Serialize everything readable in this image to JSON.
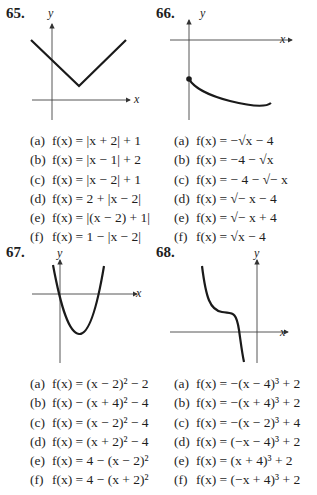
{
  "problems": [
    {
      "number": "65.",
      "graph": {
        "description": "V-shaped absolute value graph with vertex at (2, 1)",
        "x_axis_label": "x",
        "y_axis_label": "y"
      },
      "choices": [
        {
          "label": "(a)",
          "expr": "f(x) = |x + 2| + 1"
        },
        {
          "label": "(b)",
          "expr": "f(x) = |x − 1| + 2"
        },
        {
          "label": "(c)",
          "expr": "f(x) = |x − 2| + 1"
        },
        {
          "label": "(d)",
          "expr": "f(x) = 2 + |x − 2|"
        },
        {
          "label": "(e)",
          "expr": "f(x) = |(x − 2) + 1|"
        },
        {
          "label": "(f)",
          "expr": "f(x) = 1 − |x − 2|"
        }
      ]
    },
    {
      "number": "66.",
      "graph": {
        "description": "Decreasing square-root curve starting at closed point on y-axis below origin",
        "x_axis_label": "x",
        "y_axis_label": "y"
      },
      "choices": [
        {
          "label": "(a)",
          "expr": "f(x) = −√x − 4"
        },
        {
          "label": "(b)",
          "expr": "f(x) = −4 − √x"
        },
        {
          "label": "(c)",
          "expr": "f(x) =  − 4 − √− x"
        },
        {
          "label": "(d)",
          "expr": "f(x) = √− x − 4"
        },
        {
          "label": "(e)",
          "expr": "f(x) = √− x + 4"
        },
        {
          "label": "(f)",
          "expr": "f(x) = √x − 4"
        }
      ]
    },
    {
      "number": "67.",
      "graph": {
        "description": "Upward parabola crossing x-axis at origin with vertex below x-axis",
        "x_axis_label": "x",
        "y_axis_label": "y"
      },
      "choices": [
        {
          "label": "(a)",
          "expr": "f(x) = (x − 2)² − 2"
        },
        {
          "label": "(b)",
          "expr": "f(x) − (x + 4)² − 4"
        },
        {
          "label": "(c)",
          "expr": "f(x) = (x − 2)² − 4"
        },
        {
          "label": "(d)",
          "expr": "f(x) = (x + 2)² − 4"
        },
        {
          "label": "(e)",
          "expr": "f(x) = 4 − (x − 2)²"
        },
        {
          "label": "(f)",
          "expr": "f(x) = 4 − (x + 2)²"
        }
      ]
    },
    {
      "number": "68.",
      "graph": {
        "description": "Decreasing cubic curve with inflection point left of y-axis above x-axis",
        "x_axis_label": "x",
        "y_axis_label": "y"
      },
      "choices": [
        {
          "label": "(a)",
          "expr": "f(x) = −(x − 4)³ + 2"
        },
        {
          "label": "(b)",
          "expr": "f(x) = −(x + 4)³ + 2"
        },
        {
          "label": "(c)",
          "expr": "f(x) = −(x − 2)³ + 4"
        },
        {
          "label": "(d)",
          "expr": "f(x) = (−x − 4)³ + 2"
        },
        {
          "label": "(e)",
          "expr": "f(x) = (x + 4)³ + 2"
        },
        {
          "label": "(f)",
          "expr": "f(x) = (−x + 4)³ + 2"
        }
      ]
    }
  ]
}
